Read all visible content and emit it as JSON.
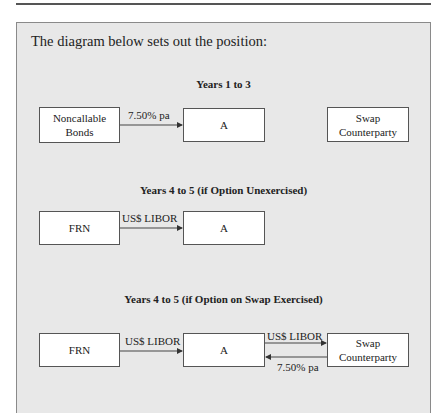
{
  "intro": "The diagram below sets out the position:",
  "sections": [
    {
      "heading": "Years 1 to 3",
      "boxes": {
        "left": "Noncallable Bonds",
        "left_line1": "Noncallable",
        "left_line2": "Bonds",
        "center": "A",
        "right_line1": "Swap",
        "right_line2": "Counterparty"
      },
      "arrows": [
        {
          "from": "Noncallable Bonds",
          "to": "A",
          "label": "7.50% pa"
        }
      ]
    },
    {
      "heading": "Years 4 to 5 (if Option Unexercised)",
      "boxes": {
        "left": "FRN",
        "center": "A"
      },
      "arrows": [
        {
          "from": "FRN",
          "to": "A",
          "label": "US$ LIBOR"
        }
      ]
    },
    {
      "heading": "Years 4 to 5 (if Option on Swap Exercised)",
      "boxes": {
        "left": "FRN",
        "center": "A",
        "right_line1": "Swap",
        "right_line2": "Counterparty"
      },
      "arrows": [
        {
          "from": "FRN",
          "to": "A",
          "label": "US$ LIBOR"
        },
        {
          "from": "A",
          "to": "Swap Counterparty",
          "label": "US$ LIBOR"
        },
        {
          "from": "Swap Counterparty",
          "to": "A",
          "label": "7.50% pa"
        }
      ]
    }
  ]
}
